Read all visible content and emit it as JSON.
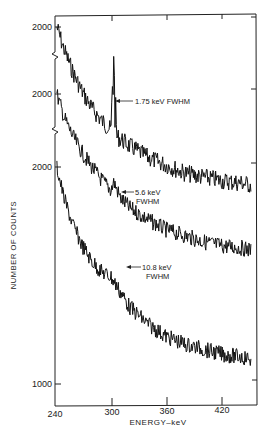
{
  "chart_data": {
    "type": "line",
    "title": "",
    "xlabel": "ENERGY–keV",
    "ylabel": "NUMBER OF COUNTS",
    "x_ticks": [
      240,
      300,
      360,
      420
    ],
    "xlim": [
      240,
      450
    ],
    "y_tick_labels": [
      "2000",
      "2000",
      "2000",
      "1000"
    ],
    "y_scale": "offset stacked spectra (broken axis)",
    "grid": false,
    "legend": null,
    "series": [
      {
        "name": "1.75 keV FWHM",
        "annotation": "1.75 keV FWHM",
        "peak_energy_keV": 303,
        "offset_label": "2000",
        "x": [
          242,
          250,
          260,
          270,
          280,
          290,
          300,
          303,
          306,
          320,
          340,
          360,
          380,
          400,
          420,
          440,
          450
        ],
        "values": [
          2000,
          1880,
          1760,
          1660,
          1580,
          1520,
          1470,
          1900,
          1440,
          1390,
          1330,
          1290,
          1250,
          1230,
          1210,
          1200,
          1190
        ]
      },
      {
        "name": "5.6 keV FWHM",
        "annotation": "5.6 keV\nFWHM",
        "peak_energy_keV": 303,
        "offset_label": "2000",
        "x": [
          242,
          250,
          260,
          270,
          280,
          290,
          300,
          303,
          310,
          320,
          340,
          360,
          380,
          400,
          420,
          440,
          450
        ],
        "values": [
          2000,
          1880,
          1780,
          1700,
          1630,
          1570,
          1520,
          1560,
          1480,
          1430,
          1370,
          1320,
          1290,
          1260,
          1240,
          1230,
          1220
        ]
      },
      {
        "name": "10.8 keV FWHM",
        "annotation": "10.8 keV\nFWHM",
        "peak_energy_keV": 303,
        "offset_label": "2000",
        "x": [
          242,
          250,
          260,
          270,
          280,
          290,
          300,
          310,
          320,
          340,
          360,
          380,
          400,
          420,
          440,
          450
        ],
        "values": [
          2000,
          1870,
          1760,
          1680,
          1620,
          1580,
          1560,
          1500,
          1440,
          1370,
          1320,
          1290,
          1270,
          1250,
          1240,
          1230
        ]
      }
    ]
  },
  "labels": {
    "ytick_a": "2000",
    "ytick_b": "2000",
    "ytick_c": "2000",
    "ytick_d": "1000",
    "xtick_240": "240",
    "xtick_300": "300",
    "xtick_360": "360",
    "xtick_420": "420",
    "xlabel": "ENERGY–keV",
    "ylabel": "NUMBER OF COUNTS",
    "ann1": "1.75 keV FWHM",
    "ann2_line1": "5.6 keV",
    "ann2_line2": "FWHM",
    "ann3_line1": "10.8 keV",
    "ann3_line2": "FWHM"
  }
}
